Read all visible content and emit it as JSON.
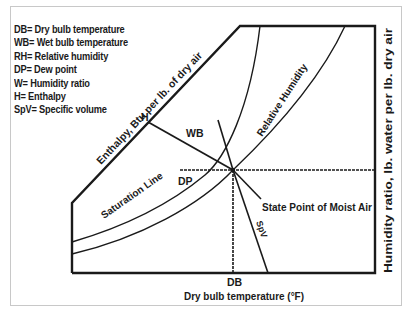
{
  "legend": [
    "DB= Dry bulb temperature",
    "WB= Wet bulb temperature",
    "RH= Relative humidity",
    "DP= Dew point",
    "W= Humidity ratio",
    "H= Enthalpy",
    "SpV= Specific volume"
  ],
  "labels": {
    "enthalpy_axis": "Enthalpy, Btu per lb. of dry air",
    "relative_humidity": "Relative Humidity",
    "saturation_line": "Saturation Line",
    "h": "H",
    "wb": "WB",
    "dp": "DP",
    "db": "DB",
    "spv": "SpV",
    "state_point": "State Point of Moist Air",
    "x_axis": "Dry bulb temperature (°F)",
    "y_axis": "Humidity ratio, lb. water per lb. dry air"
  },
  "colors": {
    "line": "#1a1a1a",
    "frame": "#c8c8c8"
  }
}
